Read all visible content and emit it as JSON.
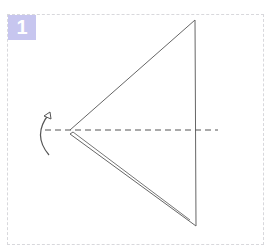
{
  "step": {
    "number": "1",
    "badge_color": "#c7c6ef",
    "frame_border_color": "#d8d8dc"
  },
  "diagram": {
    "line_color": "#555555",
    "shapes": {
      "triangle": {
        "apex_top": [
          195,
          20
        ],
        "apex_left": [
          70,
          130
        ],
        "apex_bottom": [
          195,
          226
        ]
      },
      "fold_line": {
        "type": "dashed",
        "from": [
          38,
          130
        ],
        "to": [
          218,
          130
        ]
      },
      "arrow": {
        "type": "curved",
        "direction": "up",
        "icon": "curved-arrow-icon"
      }
    }
  }
}
